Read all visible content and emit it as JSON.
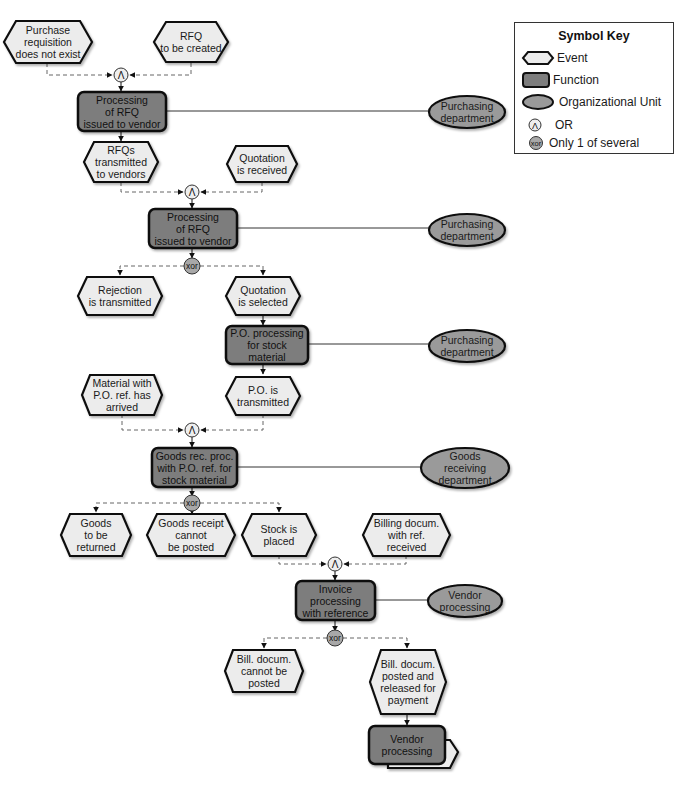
{
  "colors": {
    "event_fill": "#ececec",
    "function_fill": "#7d7d7d",
    "org_fill": "#9a9a9a",
    "outline": "#111111",
    "connector_fill": "#eeeeee",
    "xor_fill": "#a8a8a8",
    "dashed_line": "#666666"
  },
  "legend": {
    "title": "Symbol Key",
    "items": [
      {
        "symbol": "event-hexagon",
        "label": "Event"
      },
      {
        "symbol": "function-rounded-rect",
        "label": "Function"
      },
      {
        "symbol": "org-unit-ellipse",
        "label": "Organizational Unit"
      },
      {
        "symbol": "or-connector",
        "glyph": "Λ",
        "label": "OR"
      },
      {
        "symbol": "xor-connector",
        "glyph": "xor",
        "label": "Only 1 of several"
      }
    ]
  },
  "events": [
    {
      "id": "e1",
      "text": "Purchase\nrequisition\ndoes not exist"
    },
    {
      "id": "e2",
      "text": "RFQ\nto be created"
    },
    {
      "id": "e3",
      "text": "RFQs\ntransmitted\nto vendors"
    },
    {
      "id": "e4",
      "text": "Quotation\nis received"
    },
    {
      "id": "e5",
      "text": "Rejection\nis transmitted"
    },
    {
      "id": "e6",
      "text": "Quotation\nis selected"
    },
    {
      "id": "e7",
      "text": "Material with\nP.O. ref. has\narrived"
    },
    {
      "id": "e8",
      "text": "P.O. is\ntransmitted"
    },
    {
      "id": "e9",
      "text": "Goods\nto be\nreturned"
    },
    {
      "id": "e10",
      "text": "Goods receipt\ncannot\nbe posted"
    },
    {
      "id": "e11",
      "text": "Stock is\nplaced"
    },
    {
      "id": "e12",
      "text": "Billing docum.\nwith ref.\nreceived"
    },
    {
      "id": "e13",
      "text": "Bill. docum.\ncannot be\nposted"
    },
    {
      "id": "e14",
      "text": "Bill. docum.\nposted and\nreleased for\npayment"
    }
  ],
  "functions": [
    {
      "id": "f1",
      "text": "Processing\nof RFQ\nissued to vendor"
    },
    {
      "id": "f2",
      "text": "Processing\nof RFQ\nissued to vendor"
    },
    {
      "id": "f3",
      "text": "P.O. processing\nfor stock\nmaterial"
    },
    {
      "id": "f4",
      "text": "Goods rec. proc.\nwith P.O. ref. for\nstock material"
    },
    {
      "id": "f5",
      "text": "Invoice\nprocessing\nwith reference"
    },
    {
      "id": "f6",
      "text": "Vendor\nprocessing",
      "process_path": true
    }
  ],
  "org_units": [
    {
      "id": "o1",
      "text": "Purchasing\ndepartment"
    },
    {
      "id": "o2",
      "text": "Purchasing\ndepartment"
    },
    {
      "id": "o3",
      "text": "Purchasing\ndepartment"
    },
    {
      "id": "o4",
      "text": "Goods\nreceiving\ndepartment"
    },
    {
      "id": "o5",
      "text": "Vendor\nprocessing"
    }
  ],
  "connectors": [
    {
      "id": "c1",
      "type": "OR",
      "glyph": "Λ"
    },
    {
      "id": "c2",
      "type": "OR",
      "glyph": "Λ"
    },
    {
      "id": "c3",
      "type": "XOR",
      "glyph": "xor"
    },
    {
      "id": "c4",
      "type": "OR",
      "glyph": "Λ"
    },
    {
      "id": "c5",
      "type": "XOR",
      "glyph": "xor"
    },
    {
      "id": "c6",
      "type": "OR",
      "glyph": "Λ"
    },
    {
      "id": "c7",
      "type": "XOR",
      "glyph": "xor"
    }
  ]
}
